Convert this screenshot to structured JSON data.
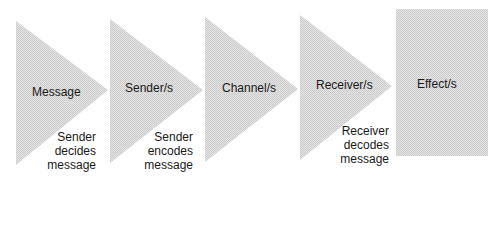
{
  "diagram": {
    "fill_color": "#d9d9d9",
    "stages": [
      {
        "label": "Message",
        "note": [
          "Sender",
          "decides",
          "message"
        ]
      },
      {
        "label": "Sender/s",
        "note": [
          "Sender",
          "encodes",
          "message"
        ]
      },
      {
        "label": "Channel/s",
        "note": []
      },
      {
        "label": "Receiver/s",
        "note": [
          "Receiver",
          "decodes",
          "message"
        ]
      },
      {
        "label": "Effect/s",
        "note": []
      }
    ]
  }
}
